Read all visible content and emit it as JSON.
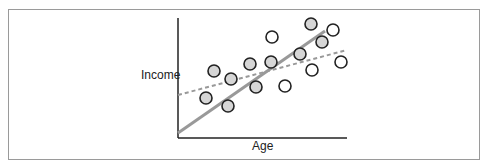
{
  "chart_data": {
    "type": "scatter",
    "title": "",
    "xlabel": "Age",
    "ylabel": "Income",
    "grid": false,
    "legend": null,
    "points": [
      {
        "x": 214,
        "y": 71,
        "fill": "gray"
      },
      {
        "x": 231,
        "y": 79,
        "fill": "gray"
      },
      {
        "x": 206,
        "y": 98,
        "fill": "gray"
      },
      {
        "x": 228,
        "y": 106,
        "fill": "gray"
      },
      {
        "x": 250,
        "y": 64,
        "fill": "gray"
      },
      {
        "x": 272,
        "y": 37,
        "fill": "white"
      },
      {
        "x": 271,
        "y": 62,
        "fill": "gray"
      },
      {
        "x": 256,
        "y": 87,
        "fill": "gray"
      },
      {
        "x": 285,
        "y": 86,
        "fill": "white"
      },
      {
        "x": 311,
        "y": 24,
        "fill": "gray"
      },
      {
        "x": 333,
        "y": 30,
        "fill": "white"
      },
      {
        "x": 322,
        "y": 42,
        "fill": "gray"
      },
      {
        "x": 300,
        "y": 54,
        "fill": "gray"
      },
      {
        "x": 312,
        "y": 70,
        "fill": "white"
      },
      {
        "x": 341,
        "y": 62,
        "fill": "white"
      }
    ],
    "lines": [
      {
        "name": "steep-fit",
        "style": "solid",
        "x1": 178,
        "y1": 133,
        "x2": 325,
        "y2": 31
      },
      {
        "name": "shallow-fit",
        "style": "dashed",
        "x1": 178,
        "y1": 95,
        "x2": 347,
        "y2": 50
      }
    ],
    "colors": {
      "gray_fill": "#d6d6d6",
      "white_fill": "#ffffff",
      "stroke": "#222222",
      "line": "#999999",
      "axis": "#222222"
    }
  }
}
